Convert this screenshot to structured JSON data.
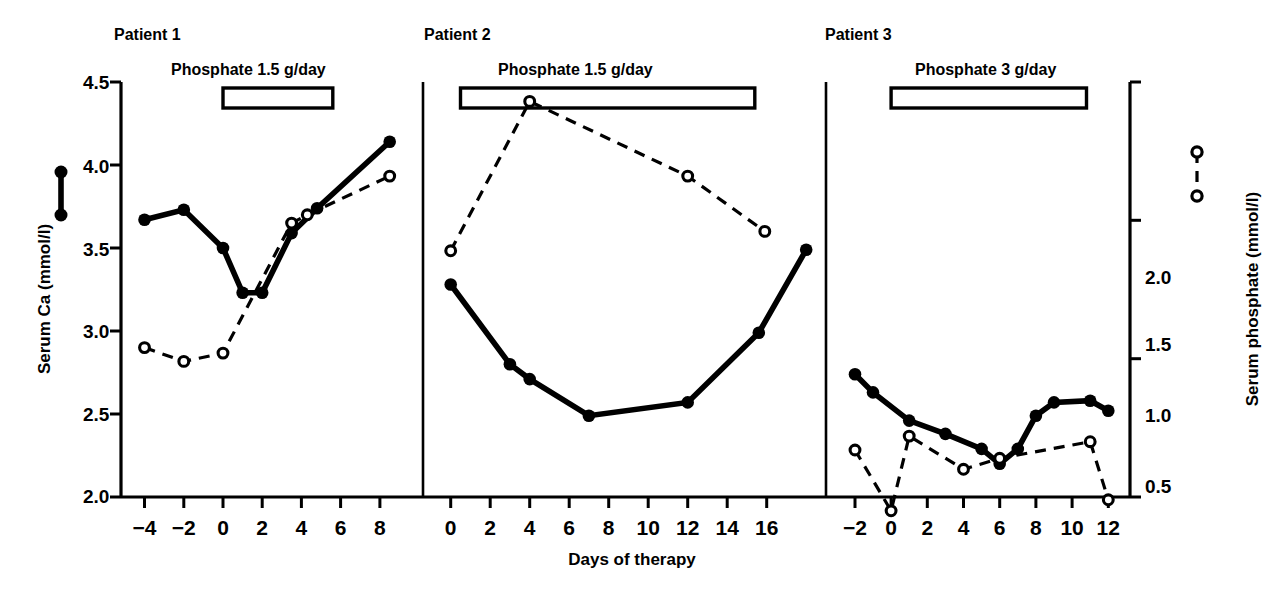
{
  "figure": {
    "xlabel": "Days of therapy",
    "left_axis_title": "Serum Ca (mmol/l)",
    "right_axis_title": "Serum phosphate (mmol/l)",
    "left_ticks": [
      "4.5",
      "4.0",
      "3.5",
      "3.0",
      "2.5",
      "2.0"
    ],
    "right_ticks": [
      "2.0",
      "1.5",
      "1.0",
      "0.5"
    ],
    "legend": {
      "calcium_symbol": "filled-circle-solid-line",
      "phosphate_symbol": "open-circle-dashed-line"
    }
  },
  "chart_data": {
    "type": "line",
    "title": "",
    "xlabel": "Days of therapy",
    "ylabel": "Serum Ca (mmol/l)",
    "y2label": "Serum phosphate (mmol/l)",
    "ylim": [
      2.0,
      4.5
    ],
    "y2lim": [
      0.5,
      2.0
    ],
    "grid": false,
    "legend_position": "outside-left-and-right",
    "panels": [
      {
        "name": "Patient 1",
        "annotation": "Phosphate 1.5 g/day",
        "treatment_bar": {
          "start_day": 0,
          "end_day": 5.6
        },
        "xlim": [
          -5.2,
          10.2
        ],
        "xticks": [
          -4,
          -2,
          0,
          2,
          4,
          6,
          8
        ],
        "series": [
          {
            "name": "Serum Ca (mmol/l)",
            "marker": "filled-circle",
            "line": "solid",
            "axis": "left",
            "x": [
              -4,
              -2,
              0,
              1,
              2,
              3.5,
              4.8,
              8.5
            ],
            "values": [
              3.67,
              3.73,
              3.5,
              3.23,
              3.23,
              3.59,
              3.74,
              4.14
            ]
          },
          {
            "name": "Serum phosphate (mmol/l)",
            "marker": "open-circle",
            "line": "dashed",
            "axis": "right",
            "x": [
              -4,
              -2,
              0,
              3.5,
              4.3,
              8.5
            ],
            "values": [
              1.04,
              0.99,
              1.02,
              1.49,
              1.52,
              1.66
            ]
          }
        ]
      },
      {
        "name": "Patient 2",
        "annotation": "Phosphate 1.5 g/day",
        "treatment_bar": {
          "start_day": 0.5,
          "end_day": 15.4
        },
        "xlim": [
          -1.4,
          19.0
        ],
        "xticks": [
          0,
          2,
          4,
          6,
          8,
          10,
          12,
          14,
          16
        ],
        "series": [
          {
            "name": "Serum Ca (mmol/l)",
            "marker": "filled-circle",
            "line": "solid",
            "axis": "left",
            "x": [
              0,
              3,
              4,
              7,
              12,
              15.6,
              18
            ],
            "values": [
              3.28,
              2.8,
              2.71,
              2.49,
              2.57,
              2.99,
              3.49
            ]
          },
          {
            "name": "Serum phosphate (mmol/l)",
            "marker": "open-circle",
            "line": "dashed",
            "axis": "right",
            "x": [
              0,
              4,
              12,
              15.9
            ],
            "values": [
              1.39,
              1.93,
              1.66,
              1.46
            ]
          }
        ]
      },
      {
        "name": "Patient 3",
        "annotation": "Phosphate 3 g/day",
        "treatment_bar": {
          "start_day": 0,
          "end_day": 10.8
        },
        "xlim": [
          -3.6,
          13.2
        ],
        "xticks": [
          -2,
          0,
          2,
          4,
          6,
          8,
          10,
          12
        ],
        "series": [
          {
            "name": "Serum Ca (mmol/l)",
            "marker": "filled-circle",
            "line": "solid",
            "axis": "left",
            "x": [
              -2,
              -1,
              1,
              3,
              5,
              6,
              7,
              8,
              9,
              11,
              12
            ],
            "values": [
              2.74,
              2.63,
              2.46,
              2.38,
              2.29,
              2.2,
              2.29,
              2.49,
              2.57,
              2.58,
              2.52
            ]
          },
          {
            "name": "Serum phosphate (mmol/l)",
            "marker": "open-circle",
            "line": "dashed",
            "axis": "right",
            "x": [
              -2,
              0,
              1,
              4,
              6,
              11,
              12
            ],
            "values": [
              0.67,
              0.45,
              0.72,
              0.6,
              0.64,
              0.7,
              0.49
            ]
          }
        ]
      }
    ]
  }
}
